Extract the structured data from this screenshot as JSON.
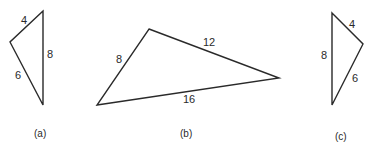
{
  "figures": [
    {
      "id": "a",
      "caption": "(a)",
      "vertices": [
        [
          43,
          11
        ],
        [
          10,
          42
        ],
        [
          43,
          105
        ]
      ],
      "sides": [
        {
          "label": "4",
          "x": 21,
          "y": 24
        },
        {
          "label": "8",
          "x": 47,
          "y": 58
        },
        {
          "label": "6",
          "x": 15,
          "y": 79
        }
      ],
      "caption_pos": {
        "x": 34,
        "y": 137
      }
    },
    {
      "id": "b",
      "caption": "(b)",
      "vertices": [
        [
          149,
          29
        ],
        [
          279,
          78
        ],
        [
          97,
          105
        ]
      ],
      "sides": [
        {
          "label": "8",
          "x": 116,
          "y": 63
        },
        {
          "label": "12",
          "x": 203,
          "y": 46
        },
        {
          "label": "16",
          "x": 183,
          "y": 103
        }
      ],
      "caption_pos": {
        "x": 180,
        "y": 137
      }
    },
    {
      "id": "c",
      "caption": "(c)",
      "vertices": [
        [
          332,
          13
        ],
        [
          363,
          44
        ],
        [
          332,
          105
        ]
      ],
      "sides": [
        {
          "label": "4",
          "x": 349,
          "y": 28
        },
        {
          "label": "8",
          "x": 321,
          "y": 59
        },
        {
          "label": "6",
          "x": 352,
          "y": 82
        }
      ],
      "caption_pos": {
        "x": 335,
        "y": 140
      }
    }
  ]
}
